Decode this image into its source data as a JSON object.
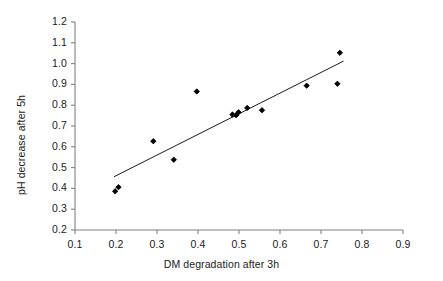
{
  "chart_data": {
    "type": "scatter",
    "title": "",
    "xlabel": "DM degradation after 3h",
    "ylabel": "pH decrease after 5h",
    "xlim": [
      0.1,
      0.9
    ],
    "ylim": [
      0.2,
      1.2
    ],
    "xticks": [
      "0.1",
      "0.2",
      "0.3",
      "0.4",
      "0.5",
      "0.6",
      "0.7",
      "0.8",
      "0.9"
    ],
    "yticks": [
      "0.2",
      "0.3",
      "0.4",
      "0.5",
      "0.6",
      "0.7",
      "0.8",
      "0.9",
      "1.0",
      "1.1",
      "1.2"
    ],
    "xtick_values": [
      0.1,
      0.2,
      0.3,
      0.4,
      0.5,
      0.6,
      0.7,
      0.8,
      0.9
    ],
    "ytick_values": [
      0.2,
      0.3,
      0.4,
      0.5,
      0.6,
      0.7,
      0.8,
      0.9,
      1.0,
      1.1,
      1.2
    ],
    "grid": false,
    "legend": false,
    "marker": "filled-diamond",
    "marker_color": "#000000",
    "axis_color": "#808080",
    "trendline_color": "#000000",
    "points": [
      {
        "x": 0.198,
        "y": 0.386
      },
      {
        "x": 0.206,
        "y": 0.406
      },
      {
        "x": 0.291,
        "y": 0.627
      },
      {
        "x": 0.341,
        "y": 0.538
      },
      {
        "x": 0.397,
        "y": 0.866
      },
      {
        "x": 0.484,
        "y": 0.755
      },
      {
        "x": 0.493,
        "y": 0.752
      },
      {
        "x": 0.499,
        "y": 0.766
      },
      {
        "x": 0.52,
        "y": 0.787
      },
      {
        "x": 0.556,
        "y": 0.776
      },
      {
        "x": 0.665,
        "y": 0.894
      },
      {
        "x": 0.74,
        "y": 0.903
      },
      {
        "x": 0.746,
        "y": 1.052
      }
    ],
    "trendline": {
      "x0": 0.195,
      "y0": 0.456,
      "x1": 0.755,
      "y1": 1.012
    }
  }
}
